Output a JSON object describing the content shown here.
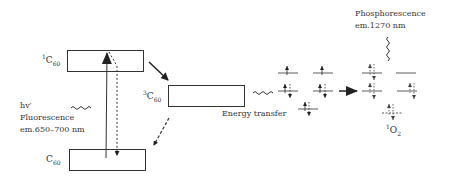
{
  "diagram": {
    "states": {
      "singlet_c60": {
        "sup": "1",
        "base": "C",
        "sub": "60"
      },
      "triplet_c60": {
        "sup": "3",
        "base": "C",
        "sub": "60"
      },
      "ground_c60": {
        "base": "C",
        "sub": "60"
      },
      "singlet_oxygen": {
        "sup": "1",
        "base": "O",
        "sub": "2"
      }
    },
    "labels": {
      "excitation": "hv′",
      "fluorescence": "Fluorescence",
      "fluorescence_em": "em.650–700 nm",
      "energy_transfer": "Energy transfer",
      "phosphorescence": "Phosphorescence",
      "phosphorescence_em": "em.1270 nm"
    },
    "colors": {
      "line": "#222222",
      "box_fill": "#ffffff"
    }
  }
}
